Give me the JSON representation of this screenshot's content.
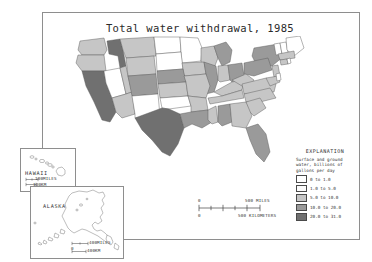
{
  "map": {
    "title": "Total water withdrawal, 1985",
    "frame_color": "#8e8e8e"
  },
  "legend": {
    "title": "EXPLANATION",
    "subtitle_lines": [
      "Surface and ground",
      "water, billions of",
      "gallons per day"
    ],
    "classes": [
      {
        "label": "0 to 1.0",
        "color": "#ffffff",
        "min": 0,
        "max": 1.0
      },
      {
        "label": "1.0 to 5.0",
        "color": "#fbfbfb",
        "min": 1.0,
        "max": 5.0
      },
      {
        "label": "5.0 to 10.0",
        "color": "#c6c6c6",
        "min": 5.0,
        "max": 10.0
      },
      {
        "label": "10.0 to 20.0",
        "color": "#9a9a9a",
        "min": 10.0,
        "max": 20.0
      },
      {
        "label": "20.0 to 31.0",
        "color": "#707070",
        "min": 20.0,
        "max": 31.0
      }
    ]
  },
  "scale_bars": {
    "main": {
      "zero_label": "0",
      "miles_value": "500",
      "miles_unit": "MILES",
      "km_value": "500",
      "km_unit": "KILOMETERS"
    },
    "hawaii": {
      "zero_label": "0",
      "miles_value": "100",
      "miles_unit": "MILES",
      "km_value": "100",
      "km_unit": "KM"
    },
    "alaska": {
      "zero_label": "0",
      "miles_value": "400",
      "miles_unit": "MILES",
      "km_value": "400",
      "km_unit": "KM"
    }
  },
  "insets": [
    {
      "name": "hawaii",
      "label": "HAWAII"
    },
    {
      "name": "alaska",
      "label": "ALASKA"
    }
  ],
  "chart_data": {
    "type": "heatmap",
    "title": "Total water withdrawal, 1985",
    "xlabel": "",
    "ylabel": "",
    "legend_position": "right",
    "grid": false,
    "value_unit": "billions of gallons per day",
    "categories": [
      "0 to 1.0",
      "1.0 to 5.0",
      "5.0 to 10.0",
      "10.0 to 20.0",
      "20.0 to 31.0"
    ],
    "colors": [
      "#ffffff",
      "#fbfbfb",
      "#c6c6c6",
      "#9a9a9a",
      "#707070"
    ],
    "regions": [
      {
        "code": "WA",
        "name": "Washington",
        "class": 2
      },
      {
        "code": "OR",
        "name": "Oregon",
        "class": 2
      },
      {
        "code": "ID",
        "name": "Idaho",
        "class": 4
      },
      {
        "code": "MT",
        "name": "Montana",
        "class": 2
      },
      {
        "code": "ND",
        "name": "North Dakota",
        "class": 0
      },
      {
        "code": "MN",
        "name": "Minnesota",
        "class": 0
      },
      {
        "code": "WI",
        "name": "Wisconsin",
        "class": 2
      },
      {
        "code": "MI",
        "name": "Michigan",
        "class": 3
      },
      {
        "code": "NY",
        "name": "New York",
        "class": 3
      },
      {
        "code": "VT",
        "name": "Vermont",
        "class": 0
      },
      {
        "code": "NH",
        "name": "New Hampshire",
        "class": 0
      },
      {
        "code": "ME",
        "name": "Maine",
        "class": 0
      },
      {
        "code": "CA",
        "name": "California",
        "class": 4
      },
      {
        "code": "NV",
        "name": "Nevada",
        "class": 0
      },
      {
        "code": "UT",
        "name": "Utah",
        "class": 2
      },
      {
        "code": "WY",
        "name": "Wyoming",
        "class": 2
      },
      {
        "code": "SD",
        "name": "South Dakota",
        "class": 0
      },
      {
        "code": "IA",
        "name": "Iowa",
        "class": 2
      },
      {
        "code": "IL",
        "name": "Illinois",
        "class": 3
      },
      {
        "code": "IN",
        "name": "Indiana",
        "class": 2
      },
      {
        "code": "OH",
        "name": "Ohio",
        "class": 3
      },
      {
        "code": "PA",
        "name": "Pennsylvania",
        "class": 3
      },
      {
        "code": "NJ",
        "name": "New Jersey",
        "class": 2
      },
      {
        "code": "MA",
        "name": "Massachusetts",
        "class": 2
      },
      {
        "code": "CT",
        "name": "Connecticut",
        "class": 2
      },
      {
        "code": "RI",
        "name": "Rhode Island",
        "class": 0
      },
      {
        "code": "AZ",
        "name": "Arizona",
        "class": 2
      },
      {
        "code": "CO",
        "name": "Colorado",
        "class": 3
      },
      {
        "code": "NE",
        "name": "Nebraska",
        "class": 3
      },
      {
        "code": "KS",
        "name": "Kansas",
        "class": 2
      },
      {
        "code": "MO",
        "name": "Missouri",
        "class": 2
      },
      {
        "code": "KY",
        "name": "Kentucky",
        "class": 2
      },
      {
        "code": "WV",
        "name": "West Virginia",
        "class": 2
      },
      {
        "code": "VA",
        "name": "Virginia",
        "class": 2
      },
      {
        "code": "MD",
        "name": "Maryland",
        "class": 2
      },
      {
        "code": "DE",
        "name": "Delaware",
        "class": 0
      },
      {
        "code": "NM",
        "name": "New Mexico",
        "class": 0
      },
      {
        "code": "OK",
        "name": "Oklahoma",
        "class": 0
      },
      {
        "code": "AR",
        "name": "Arkansas",
        "class": 2
      },
      {
        "code": "TN",
        "name": "Tennessee",
        "class": 2
      },
      {
        "code": "NC",
        "name": "North Carolina",
        "class": 2
      },
      {
        "code": "SC",
        "name": "South Carolina",
        "class": 2
      },
      {
        "code": "TX",
        "name": "Texas",
        "class": 4
      },
      {
        "code": "LA",
        "name": "Louisiana",
        "class": 3
      },
      {
        "code": "MS",
        "name": "Mississippi",
        "class": 2
      },
      {
        "code": "AL",
        "name": "Alabama",
        "class": 3
      },
      {
        "code": "GA",
        "name": "Georgia",
        "class": 2
      },
      {
        "code": "FL",
        "name": "Florida",
        "class": 3
      },
      {
        "code": "AK",
        "name": "Alaska",
        "class": 0
      },
      {
        "code": "HI",
        "name": "Hawaii",
        "class": 0
      }
    ]
  }
}
